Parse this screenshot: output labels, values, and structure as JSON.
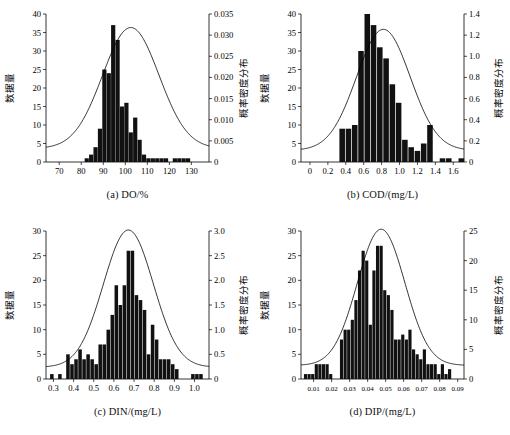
{
  "figure": {
    "width": 510,
    "height": 435,
    "background": "#ffffff",
    "line_color": "#000000",
    "bar_color": "#111111"
  },
  "common": {
    "ylabel_left": "数据量",
    "ylabel_right": "概率密度分布"
  },
  "chart_data": [
    {
      "type": "bar",
      "id": "panel-a",
      "title": "(a) DO/%",
      "xlabel": "(a) DO/%",
      "ylabel": "数据量",
      "ylabel_right": "概率密度分布",
      "xlim": [
        64,
        138
      ],
      "ylim": [
        0,
        40
      ],
      "ylim_right": [
        0,
        0.035
      ],
      "xticks": [
        70,
        80,
        90,
        100,
        110,
        120,
        130
      ],
      "xticklabels": [
        "70",
        "80",
        "90",
        "100",
        "110",
        "120",
        "130"
      ],
      "yticks": [
        0,
        5,
        10,
        15,
        20,
        25,
        30,
        35,
        40
      ],
      "yticklabels": [
        "0",
        "5",
        "10",
        "15",
        "20",
        "25",
        "30",
        "35",
        "40"
      ],
      "yticks_right": [
        0,
        0.005,
        0.01,
        0.015,
        0.02,
        0.025,
        0.03,
        0.035
      ],
      "yticklabels_right": [
        "0",
        "0.005",
        "0.010",
        "0.015",
        "0.020",
        "0.025",
        "0.030",
        "0.035"
      ],
      "grid": false,
      "bar_x": [
        82.5,
        84.5,
        86.5,
        88.5,
        90.5,
        92.5,
        94.5,
        96.5,
        98.5,
        100.5,
        102.5,
        104.5,
        106.5,
        108.5,
        110.5,
        112.5,
        114.5,
        116.5,
        118.5,
        120.5,
        122.5,
        124.5,
        126.5,
        128.5,
        130.5,
        132.5,
        134.5,
        136.5
      ],
      "bar_width": 1.9,
      "values": [
        1,
        2,
        4,
        9,
        25,
        24,
        37,
        33,
        15,
        16,
        8,
        12,
        6,
        2,
        1,
        1,
        1,
        1,
        1,
        0,
        1,
        1,
        1,
        1,
        0,
        0,
        0,
        0
      ],
      "curve": {
        "name": "probability density",
        "mean": 102.5,
        "sigma": 12.8,
        "peak": 0.0318,
        "baseline": 0.0032
      }
    },
    {
      "type": "bar",
      "id": "panel-b",
      "title": "(b) COD/(mg/L)",
      "xlabel": "(b) COD/(mg/L)",
      "ylabel": "数据量",
      "ylabel_right": "概率密度分布",
      "xlim": [
        -0.1,
        1.72
      ],
      "ylim": [
        0,
        40
      ],
      "ylim_right": [
        0,
        1.4
      ],
      "xticks": [
        0,
        0.2,
        0.4,
        0.6,
        0.8,
        1.0,
        1.2,
        1.4,
        1.6
      ],
      "xticklabels": [
        "0",
        "0.2",
        "0.4",
        "0.6",
        "0.8",
        "1.0",
        "1.2",
        "1.4",
        "1.6"
      ],
      "yticks": [
        0,
        5,
        10,
        15,
        20,
        25,
        30,
        35,
        40
      ],
      "yticklabels": [
        "0",
        "5",
        "10",
        "15",
        "20",
        "25",
        "30",
        "35",
        "40"
      ],
      "yticks_right": [
        0,
        0.2,
        0.4,
        0.6,
        0.8,
        1.0,
        1.2,
        1.4
      ],
      "yticklabels_right": [
        "0",
        "0.2",
        "0.4",
        "0.6",
        "0.8",
        "1.0",
        "1.2",
        "1.4"
      ],
      "grid": false,
      "bar_x": [
        0.36,
        0.43,
        0.5,
        0.57,
        0.64,
        0.71,
        0.78,
        0.85,
        0.92,
        0.99,
        1.06,
        1.13,
        1.2,
        1.27,
        1.34,
        1.41,
        1.48,
        1.55,
        1.62,
        1.69
      ],
      "bar_width": 0.062,
      "values": [
        9,
        9,
        10,
        30,
        40,
        37,
        31,
        28,
        21,
        16,
        6,
        4,
        3,
        5,
        10,
        0,
        1,
        1,
        0,
        1
      ],
      "curve": {
        "name": "probability density",
        "mean": 0.82,
        "sigma": 0.3,
        "peak": 1.255,
        "baseline": 0.11
      }
    },
    {
      "type": "bar",
      "id": "panel-c",
      "title": "(c) DIN/(mg/L)",
      "xlabel": "(c) DIN/(mg/L)",
      "ylabel": "数据量",
      "ylabel_right": "概率密度分布",
      "xlim": [
        0.263,
        1.072
      ],
      "ylim": [
        0,
        30
      ],
      "ylim_right": [
        0,
        3.0
      ],
      "xticks": [
        0.3,
        0.4,
        0.5,
        0.6,
        0.7,
        0.8,
        0.9,
        1.0
      ],
      "xticklabels": [
        "0.3",
        "0.4",
        "0.5",
        "0.6",
        "0.7",
        "0.8",
        "0.9",
        "1.0"
      ],
      "yticks": [
        0,
        5,
        10,
        15,
        20,
        25,
        30
      ],
      "yticklabels": [
        "0",
        "5",
        "10",
        "15",
        "20",
        "25",
        "30"
      ],
      "yticks_right": [
        0,
        0.5,
        1.0,
        1.5,
        2.0,
        2.5,
        3.0
      ],
      "yticklabels_right": [
        "0",
        "0.5",
        "1.0",
        "1.5",
        "2.0",
        "2.5",
        "3.0"
      ],
      "grid": false,
      "bar_x": [
        0.292,
        0.312,
        0.332,
        0.352,
        0.372,
        0.392,
        0.412,
        0.432,
        0.452,
        0.472,
        0.492,
        0.512,
        0.532,
        0.552,
        0.572,
        0.592,
        0.612,
        0.632,
        0.652,
        0.672,
        0.692,
        0.712,
        0.732,
        0.752,
        0.772,
        0.792,
        0.812,
        0.832,
        0.852,
        0.872,
        0.892,
        0.912,
        0.932,
        0.952,
        0.972,
        0.992,
        1.012,
        1.032,
        1.052
      ],
      "bar_width": 0.0175,
      "values": [
        1,
        0,
        1,
        0,
        5,
        3,
        4,
        6,
        4,
        5,
        4,
        3,
        7,
        7,
        10,
        13,
        19,
        15,
        19,
        26,
        26,
        17,
        16,
        14,
        5,
        11,
        8,
        4,
        4,
        4,
        3,
        2,
        0,
        0,
        0,
        1,
        1,
        1,
        0
      ],
      "curve": {
        "name": "probability density",
        "mean": 0.672,
        "sigma": 0.124,
        "peak": 3.02,
        "baseline": 0.24
      }
    },
    {
      "type": "bar",
      "id": "panel-d",
      "title": "(d) DIP/(mg/L)",
      "xlabel": "(d) DIP/(mg/L)",
      "ylabel": "数据量",
      "ylabel_right": "概率密度分布",
      "xlim": [
        0.003,
        0.0935
      ],
      "ylim": [
        0,
        30
      ],
      "ylim_right": [
        0,
        25
      ],
      "xticks": [
        0.01,
        0.02,
        0.03,
        0.04,
        0.05,
        0.06,
        0.07,
        0.08,
        0.09
      ],
      "xticklabels": [
        "0.01",
        "0.02",
        "0.03",
        "0.04",
        "0.05",
        "0.06",
        "0.07",
        "0.08",
        "0.09"
      ],
      "yticks": [
        0,
        5,
        10,
        15,
        20,
        25,
        30
      ],
      "yticklabels": [
        "0",
        "5",
        "10",
        "15",
        "20",
        "25",
        "30"
      ],
      "yticks_right": [
        0,
        5,
        10,
        15,
        20,
        25
      ],
      "yticklabels_right": [
        "0",
        "5",
        "10",
        "15",
        "20",
        "25"
      ],
      "grid": false,
      "bar_x": [
        0.0055,
        0.0075,
        0.0095,
        0.0115,
        0.0135,
        0.0155,
        0.0175,
        0.0195,
        0.0215,
        0.0235,
        0.0255,
        0.0275,
        0.0295,
        0.0315,
        0.0335,
        0.0355,
        0.0375,
        0.0395,
        0.0415,
        0.0435,
        0.0455,
        0.0475,
        0.0495,
        0.0515,
        0.0535,
        0.0555,
        0.0575,
        0.0595,
        0.0615,
        0.0635,
        0.0655,
        0.0675,
        0.0695,
        0.0715,
        0.0735,
        0.0755,
        0.0775,
        0.0795,
        0.0815,
        0.0835,
        0.0855,
        0.0875
      ],
      "bar_width": 0.00175,
      "values": [
        1,
        1,
        1,
        3,
        3,
        3,
        3,
        1,
        0,
        0,
        8,
        10,
        10,
        12,
        16,
        22,
        26,
        24,
        11,
        22,
        27,
        27,
        18,
        17,
        14,
        8,
        8,
        9,
        8,
        10,
        6,
        5,
        4,
        6,
        3,
        3,
        3,
        1,
        3,
        1,
        2,
        0
      ],
      "curve": {
        "name": "probability density",
        "mean": 0.0475,
        "sigma": 0.0132,
        "peak": 25.3,
        "baseline": 2.3
      }
    }
  ]
}
